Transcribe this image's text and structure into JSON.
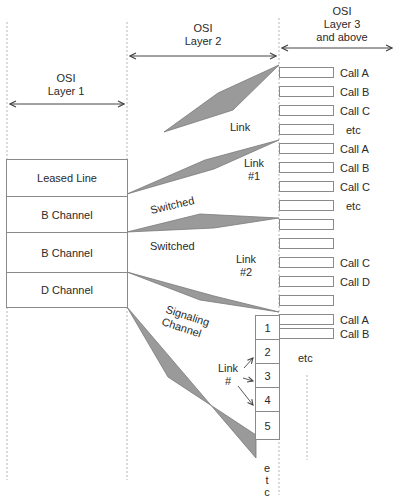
{
  "headers": {
    "layer1": "OSI\nLayer 1",
    "layer1_line1": "OSI",
    "layer1_line2": "Layer 1",
    "layer2_line1": "OSI",
    "layer2_line2": "Layer 2",
    "layer3_line1": "OSI",
    "layer3_line2": "Layer 3",
    "layer3_line3": "and above"
  },
  "physical_channels": [
    {
      "label": "Leased Line"
    },
    {
      "label": "B Channel"
    },
    {
      "label": "B Channel"
    },
    {
      "label": "D Channel"
    }
  ],
  "link_labels": {
    "link": "Link",
    "link1_a": "Link",
    "link1_b": "#1",
    "link2_a": "Link",
    "link2_b": "#2",
    "switched_1": "Switched",
    "switched_2": "Switched",
    "signaling_1": "Signaling",
    "signaling_2": "Channel",
    "link_num_a": "Link",
    "link_num_b": "#"
  },
  "calls": [
    {
      "label": "Call A"
    },
    {
      "label": "Call B"
    },
    {
      "label": "Call C"
    },
    {
      "label": "etc"
    },
    {
      "label": "Call A"
    },
    {
      "label": "Call B"
    },
    {
      "label": "Call C"
    },
    {
      "label": "etc"
    },
    {
      "label": ""
    },
    {
      "label": ""
    },
    {
      "label": "Call C"
    },
    {
      "label": "Call D"
    },
    {
      "label": ""
    },
    {
      "label": "Call A"
    },
    {
      "label": "Call B"
    }
  ],
  "calls_etc": "etc",
  "link_numbers": [
    "1",
    "2",
    "3",
    "4",
    "5"
  ],
  "link_numbers_etc": [
    "e",
    "t",
    "c"
  ],
  "colors": {
    "wedge_fill": "#9a9a9a",
    "wedge_stroke": "#7a7a7a",
    "box_border": "#8a8a8a",
    "dashed_line": "#b0b0b0"
  }
}
